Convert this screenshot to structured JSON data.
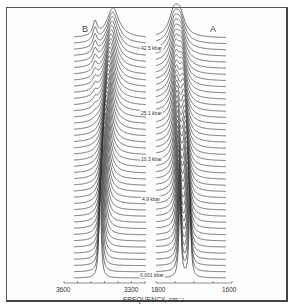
{
  "chart_data": {
    "type": "line",
    "title": "",
    "xlabel": "FREQUENCY, cm⁻¹",
    "ylabel": "",
    "panels": [
      {
        "name": "B",
        "x_range": [
          3600,
          3300
        ],
        "tick_labels": [
          "3600",
          "3300"
        ],
        "description": "O-H stretch region; single sharp peak at low pressure broadening and shifting with a shoulder at high pressure"
      },
      {
        "name": "A",
        "x_range": [
          1800,
          1600
        ],
        "tick_labels": [
          "1800",
          "1600"
        ],
        "description": "Doublet at low pressure merging into one broad band at high pressure"
      }
    ],
    "pressure_labels": [
      "42.5 kbar",
      "25.1 kbar",
      "10.3 kbar",
      "4.9 kbar",
      "0.001 kbar"
    ],
    "n_traces": 40,
    "grid": false,
    "legend": "none"
  },
  "labels": {
    "panel_b": "B",
    "panel_a": "A",
    "p_top": "42.5 kbar",
    "p_2": "25.1 kbar",
    "p_3": "10.3 kbar",
    "p_4": "4.9 kbar",
    "p_bottom": "0.001 kbar",
    "tick_3600": "3600",
    "tick_3300": "3300",
    "tick_1800": "1800",
    "tick_1600": "1600",
    "axis_title": "FREQUENCY, cm⁻¹"
  },
  "render": {
    "line_color": "#3a3a3a",
    "n_traces": 40,
    "base_y": 278,
    "top_y": 38,
    "panel_b": {
      "x0": 74,
      "x1": 146
    },
    "panel_a": {
      "x0": 156,
      "x1": 226
    }
  }
}
